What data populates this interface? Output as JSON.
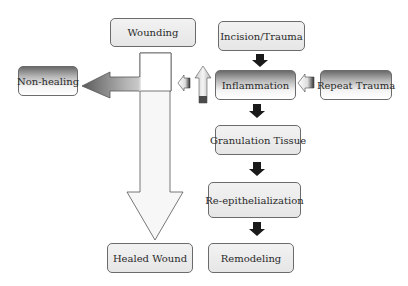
{
  "diagram": {
    "nodes": {
      "wounding": "Wounding",
      "incision": "Incision/Trauma",
      "inflammation": "Inflammation",
      "repeat_trauma": "Repeat Trauma",
      "non_healing": "Non-healing",
      "granulation": "Granulation Tissue",
      "reepithelialization": "Re-epithelialization",
      "healed": "Healed Wound",
      "remodeling": "Remodeling"
    },
    "edges": [
      {
        "from": "Incision/Trauma",
        "to": "Inflammation"
      },
      {
        "from": "Inflammation",
        "to": "Granulation Tissue"
      },
      {
        "from": "Granulation Tissue",
        "to": "Re-epithelialization"
      },
      {
        "from": "Re-epithelialization",
        "to": "Remodeling"
      },
      {
        "from": "Repeat Trauma",
        "to": "Inflammation"
      },
      {
        "from": "Inflammation",
        "to": "Wounding"
      },
      {
        "from": "Wounding",
        "to": "Non-healing"
      },
      {
        "from": "Wounding",
        "to": "Healed Wound"
      }
    ]
  }
}
